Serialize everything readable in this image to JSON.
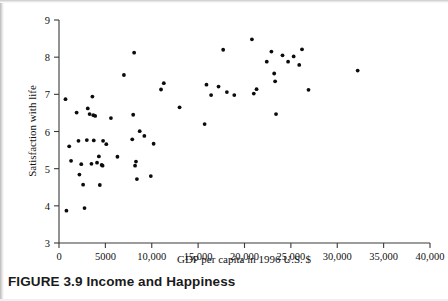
{
  "figure": {
    "caption_number": "FIGURE 3.9",
    "caption_title": "Income and Happiness"
  },
  "chart_data": {
    "type": "scatter",
    "title": "",
    "xlabel": "GDP per capita in 1996 U.S. $",
    "ylabel": "Satisfaction with life",
    "xlim": [
      0,
      40000
    ],
    "ylim": [
      3,
      9
    ],
    "grid": false,
    "legend": null,
    "xticks": [
      0,
      5000,
      10000,
      15000,
      20000,
      25000,
      30000,
      35000,
      40000
    ],
    "xtick_labels": [
      "0",
      "5000",
      "10,000",
      "15,000",
      "20,000",
      "25,000",
      "30,000",
      "35,000",
      "40,000"
    ],
    "yticks": [
      3,
      4,
      5,
      6,
      7,
      8,
      9
    ],
    "ytick_labels": [
      "3",
      "4",
      "5",
      "6",
      "7",
      "8",
      "9"
    ],
    "marker": "filled-circle",
    "marker_color": "#0b0b0b",
    "points": [
      [
        700,
        6.87
      ],
      [
        800,
        3.87
      ],
      [
        1100,
        5.6
      ],
      [
        1300,
        5.21
      ],
      [
        1900,
        6.51
      ],
      [
        2100,
        5.75
      ],
      [
        2200,
        4.84
      ],
      [
        2400,
        5.12
      ],
      [
        2600,
        4.57
      ],
      [
        2750,
        3.94
      ],
      [
        3000,
        5.77
      ],
      [
        3100,
        6.62
      ],
      [
        3300,
        6.47
      ],
      [
        3500,
        5.13
      ],
      [
        3600,
        6.94
      ],
      [
        3700,
        6.44
      ],
      [
        3750,
        5.76
      ],
      [
        3900,
        6.42
      ],
      [
        4100,
        5.16
      ],
      [
        4300,
        5.33
      ],
      [
        4400,
        4.56
      ],
      [
        4600,
        5.1
      ],
      [
        4700,
        5.08
      ],
      [
        4750,
        5.75
      ],
      [
        5100,
        5.66
      ],
      [
        5600,
        6.36
      ],
      [
        6300,
        5.32
      ],
      [
        7000,
        7.52
      ],
      [
        7900,
        5.79
      ],
      [
        8000,
        6.45
      ],
      [
        8100,
        8.12
      ],
      [
        8200,
        5.08
      ],
      [
        8300,
        5.19
      ],
      [
        8400,
        4.72
      ],
      [
        8700,
        6.01
      ],
      [
        9200,
        5.88
      ],
      [
        9900,
        4.8
      ],
      [
        10200,
        5.67
      ],
      [
        11000,
        7.13
      ],
      [
        11300,
        7.3
      ],
      [
        13000,
        6.65
      ],
      [
        15700,
        6.2
      ],
      [
        15900,
        7.26
      ],
      [
        16400,
        6.98
      ],
      [
        17200,
        7.21
      ],
      [
        17700,
        8.2
      ],
      [
        18100,
        7.06
      ],
      [
        18900,
        6.98
      ],
      [
        20800,
        8.48
      ],
      [
        21000,
        7.02
      ],
      [
        21300,
        7.14
      ],
      [
        22400,
        7.88
      ],
      [
        22900,
        8.15
      ],
      [
        23200,
        7.56
      ],
      [
        23300,
        7.35
      ],
      [
        23400,
        6.47
      ],
      [
        24100,
        8.05
      ],
      [
        24700,
        7.88
      ],
      [
        25300,
        8.02
      ],
      [
        25900,
        7.79
      ],
      [
        26200,
        8.21
      ],
      [
        26900,
        7.12
      ],
      [
        32200,
        7.64
      ]
    ]
  }
}
